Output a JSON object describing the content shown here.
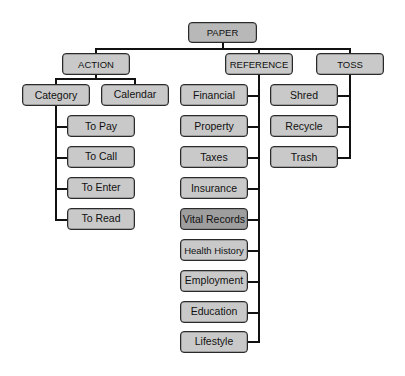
{
  "diagram": {
    "title": "PAPER",
    "colors": {
      "box_fill": "#c9c9c9",
      "root_fill": "#b8b8b8",
      "highlight_fill": "#9e9e9e",
      "line": "#111111",
      "border": "#2a2a2a"
    },
    "root": {
      "label": "PAPER"
    },
    "branches": [
      {
        "label": "ACTION",
        "children": [
          {
            "label": "Category",
            "children": [
              {
                "label": "To Pay"
              },
              {
                "label": "To Call"
              },
              {
                "label": "To Enter"
              },
              {
                "label": "To Read"
              }
            ]
          },
          {
            "label": "Calendar"
          }
        ]
      },
      {
        "label": "REFERENCE",
        "children": [
          {
            "label": "Financial"
          },
          {
            "label": "Property"
          },
          {
            "label": "Taxes"
          },
          {
            "label": "Insurance"
          },
          {
            "label": "Vital Records",
            "highlighted": true
          },
          {
            "label": "Health History"
          },
          {
            "label": "Employment"
          },
          {
            "label": "Education"
          },
          {
            "label": "Lifestyle"
          }
        ]
      },
      {
        "label": "TOSS",
        "children": [
          {
            "label": "Shred"
          },
          {
            "label": "Recycle"
          },
          {
            "label": "Trash"
          }
        ]
      }
    ]
  }
}
